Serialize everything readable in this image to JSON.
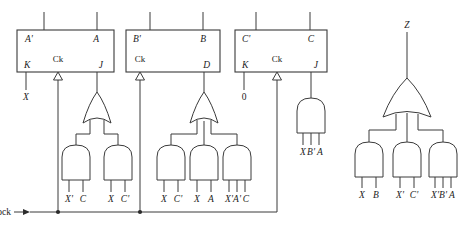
{
  "diagram": {
    "clock_label": "Clock",
    "output_label": "Z"
  },
  "flipflops": [
    {
      "id": "ff-a",
      "out_qbar": "A'",
      "out_q": "A",
      "in_left": "K",
      "in_clock": "Ck",
      "in_right": "J",
      "left_input_signal": "X"
    },
    {
      "id": "ff-b",
      "out_qbar": "B'",
      "out_q": "B",
      "in_left": "Ck",
      "in_clock": "Ck",
      "in_right": "D",
      "left_input_signal": ""
    },
    {
      "id": "ff-c",
      "out_qbar": "C'",
      "out_q": "C",
      "in_left": "K",
      "in_clock": "Ck",
      "in_right": "J",
      "left_input_signal": "0"
    }
  ],
  "logic_blocks": [
    {
      "id": "block-ja",
      "feeds": "J of flip-flop A",
      "or_gate_inputs": 2,
      "and_gates": [
        {
          "inputs": [
            "X'",
            "C"
          ]
        },
        {
          "inputs": [
            "X",
            "C'"
          ]
        }
      ]
    },
    {
      "id": "block-d",
      "feeds": "D of flip-flop B",
      "or_gate_inputs": 3,
      "and_gates": [
        {
          "inputs": [
            "X",
            "C'"
          ]
        },
        {
          "inputs": [
            "X",
            "A"
          ]
        },
        {
          "inputs": [
            "X'",
            "A'",
            "C"
          ]
        }
      ]
    },
    {
      "id": "block-jc",
      "feeds": "J of flip-flop C",
      "or_gate_inputs": 0,
      "and_gates": [
        {
          "inputs": [
            "X",
            "B'",
            "A"
          ]
        }
      ]
    },
    {
      "id": "block-z",
      "feeds": "Output Z",
      "or_gate_inputs": 3,
      "and_gates": [
        {
          "inputs": [
            "X",
            "B"
          ]
        },
        {
          "inputs": [
            "X'",
            "C'"
          ]
        },
        {
          "inputs": [
            "X'",
            "B'",
            "A"
          ]
        }
      ]
    }
  ],
  "input_labels": {
    "block_ja": [
      "X'",
      "C",
      "X",
      "C'"
    ],
    "block_d": [
      "X",
      "C'",
      "X",
      "A",
      "X'",
      "A'",
      "C"
    ],
    "block_jc": [
      "X",
      "B'",
      "A"
    ],
    "block_z": [
      "X",
      "B",
      "X'",
      "C'",
      "X'",
      "B'",
      "A"
    ]
  },
  "colors": {
    "line": "#3a3a3a",
    "text": "#1c1c1c",
    "background": "#ffffff"
  }
}
